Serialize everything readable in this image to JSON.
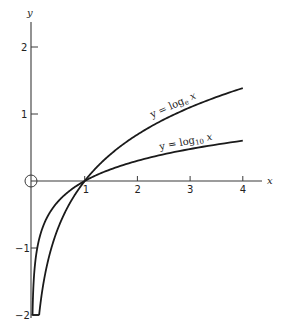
{
  "chart_data": {
    "type": "line",
    "title": "",
    "xlabel": "x",
    "ylabel": "y",
    "xlim": [
      0,
      4.4
    ],
    "ylim": [
      -2,
      2.3
    ],
    "grid": false,
    "legend": "none (curves labeled inline)",
    "x_ticks": [
      "1",
      "2",
      "3",
      "4"
    ],
    "y_ticks": [
      "2",
      "1",
      "-1",
      "-2"
    ],
    "origin_marker": "circle at origin",
    "series": [
      {
        "name": "y = log_e x",
        "label_main": "y = log",
        "label_sub": "e",
        "label_tail": " x",
        "x": [
          0.135,
          0.25,
          0.5,
          1,
          1.5,
          2,
          2.5,
          3,
          3.5,
          4
        ],
        "values": [
          -2,
          -1.386,
          -0.693,
          0,
          0.405,
          0.693,
          0.916,
          1.099,
          1.253,
          1.386
        ]
      },
      {
        "name": "y = log_10 x",
        "label_main": "y = log",
        "label_sub": "10",
        "label_tail": " x",
        "x": [
          0.01,
          0.05,
          0.1,
          0.25,
          0.5,
          1,
          1.5,
          2,
          2.5,
          3,
          3.5,
          4
        ],
        "values": [
          -2,
          -1.301,
          -1,
          -0.602,
          -0.301,
          0,
          0.176,
          0.301,
          0.398,
          0.477,
          0.544,
          0.602
        ]
      }
    ]
  }
}
